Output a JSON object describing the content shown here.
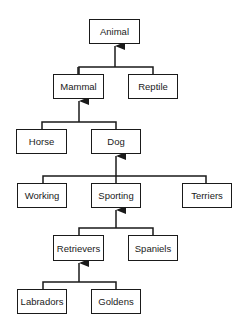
{
  "diagram": {
    "type": "inheritance-hierarchy",
    "nodes": {
      "animal": "Animal",
      "mammal": "Mammal",
      "reptile": "Reptile",
      "horse": "Horse",
      "dog": "Dog",
      "working": "Working",
      "sporting": "Sporting",
      "terriers": "Terriers",
      "retrievers": "Retrievers",
      "spaniels": "Spaniels",
      "labradors": "Labradors",
      "goldens": "Goldens"
    },
    "edges": [
      {
        "from": "mammal",
        "to": "animal"
      },
      {
        "from": "reptile",
        "to": "animal"
      },
      {
        "from": "horse",
        "to": "mammal"
      },
      {
        "from": "dog",
        "to": "mammal"
      },
      {
        "from": "working",
        "to": "dog"
      },
      {
        "from": "sporting",
        "to": "dog"
      },
      {
        "from": "terriers",
        "to": "dog"
      },
      {
        "from": "retrievers",
        "to": "sporting"
      },
      {
        "from": "spaniels",
        "to": "sporting"
      },
      {
        "from": "labradors",
        "to": "retrievers"
      },
      {
        "from": "goldens",
        "to": "retrievers"
      }
    ],
    "colors": {
      "line": "#1a1a1a",
      "box_fill": "#ffffff",
      "background": "#ffffff"
    }
  }
}
